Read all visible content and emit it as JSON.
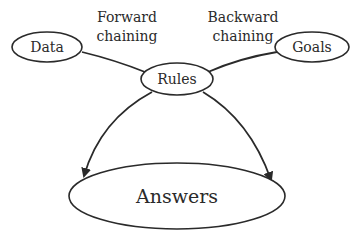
{
  "diagram": {
    "type": "flow",
    "colors": {
      "stroke": "#2a2a2a",
      "background": "#ffffff",
      "text": "#2a2a2a"
    },
    "nodes": {
      "data": {
        "label": "Data"
      },
      "goals": {
        "label": "Goals"
      },
      "rules": {
        "label": "Rules"
      },
      "answers": {
        "label": "Answers"
      }
    },
    "edge_labels": {
      "forward": {
        "line1": "Forward",
        "line2": "chaining"
      },
      "backward": {
        "line1": "Backward",
        "line2": "chaining"
      }
    },
    "edges": [
      {
        "from": "Data",
        "to": "Rules",
        "arrow": false
      },
      {
        "from": "Goals",
        "to": "Rules",
        "arrow": false
      },
      {
        "from": "Rules",
        "to": "Answers",
        "arrow": true,
        "side": "left"
      },
      {
        "from": "Rules",
        "to": "Answers",
        "arrow": true,
        "side": "right"
      }
    ]
  }
}
